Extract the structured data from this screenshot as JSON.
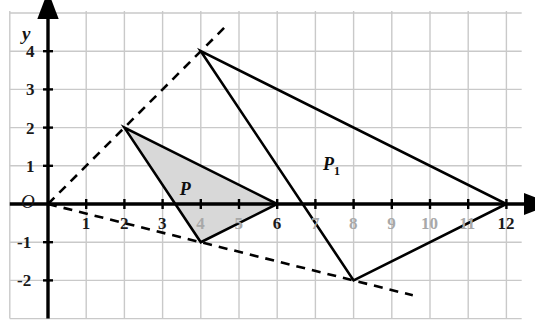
{
  "figure": {
    "background_color": "#ffffff",
    "grid_color": "#c9c9c9",
    "axis_color": "#000000",
    "shade_fill": "#d8d8d8",
    "tick_label_color": "#1a1a1a",
    "faint_tick_label_color": "#a8a8a8"
  },
  "axes": {
    "x_label": "x",
    "y_label": "y",
    "origin_label": "O",
    "x_ticks": [
      {
        "value": 1,
        "label": "1",
        "faint": false
      },
      {
        "value": 2,
        "label": "2",
        "faint": false
      },
      {
        "value": 3,
        "label": "3",
        "faint": false
      },
      {
        "value": 4,
        "label": "4",
        "faint": true
      },
      {
        "value": 5,
        "label": "5",
        "faint": true
      },
      {
        "value": 6,
        "label": "6",
        "faint": false
      },
      {
        "value": 7,
        "label": "7",
        "faint": true
      },
      {
        "value": 8,
        "label": "8",
        "faint": true
      },
      {
        "value": 9,
        "label": "9",
        "faint": true
      },
      {
        "value": 10,
        "label": "10",
        "faint": true
      },
      {
        "value": 11,
        "label": "11",
        "faint": true
      },
      {
        "value": 12,
        "label": "12",
        "faint": false
      }
    ],
    "y_ticks": [
      {
        "value": 4,
        "label": "4",
        "faint": false
      },
      {
        "value": 3,
        "label": "3",
        "faint": false
      },
      {
        "value": 2,
        "label": "2",
        "faint": false
      },
      {
        "value": 1,
        "label": "1",
        "faint": false
      },
      {
        "value": -1,
        "label": "-1",
        "faint": false
      },
      {
        "value": -2,
        "label": "-2",
        "faint": false
      }
    ]
  },
  "chart_data": {
    "type": "scatter",
    "xlabel": "x",
    "ylabel": "y",
    "xlim": [
      -1,
      12.4
    ],
    "ylim": [
      -3,
      5
    ],
    "grid": true,
    "legend": null,
    "shapes": [
      {
        "name": "P",
        "label": "P",
        "label_position": [
          3.45,
          0.62
        ],
        "vertices": [
          [
            2,
            2
          ],
          [
            4,
            -1
          ],
          [
            6,
            0
          ]
        ],
        "filled": true,
        "fill": "#d8d8d8",
        "stroke": "#000000",
        "stroke_width": 2.6
      },
      {
        "name": "P1",
        "label": "P₁",
        "label_position": [
          7.2,
          1.28
        ],
        "vertices": [
          [
            4,
            4
          ],
          [
            8,
            -2
          ],
          [
            12,
            0
          ]
        ],
        "filled": false,
        "fill": "none",
        "stroke": "#000000",
        "stroke_width": 2.6
      }
    ],
    "rays": [
      {
        "name": "ray-through-top-vertices",
        "from": [
          0,
          0
        ],
        "through": [
          [
            2,
            2
          ],
          [
            4,
            4
          ]
        ],
        "to": [
          4.72,
          4.72
        ],
        "style": "dashed"
      },
      {
        "name": "ray-through-bottom-vertices",
        "from": [
          0,
          0
        ],
        "through": [
          [
            4,
            -1
          ],
          [
            8,
            -2
          ]
        ],
        "to": [
          9.55,
          -2.39
        ],
        "style": "dashed"
      }
    ],
    "centre_of_enlargement": [
      0,
      0
    ],
    "scale_factor": 2
  }
}
